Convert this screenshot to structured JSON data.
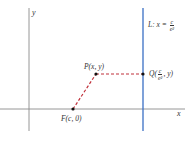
{
  "diagram": {
    "axes": {
      "x_label": "x",
      "y_label": "y",
      "axis_color": "#888888"
    },
    "directrix": {
      "prefix": "L: x = ",
      "fraction_numerator": "c",
      "fraction_denominator": "e²",
      "color": "#3a6fc4"
    },
    "points": {
      "P": {
        "label": "P(x, y)"
      },
      "F": {
        "label": "F(c, 0)"
      },
      "Q": {
        "prefix": "Q(",
        "fraction_numerator": "c",
        "fraction_denominator": "e²",
        "suffix": ", y)"
      }
    },
    "segments": {
      "color": "#c0303a",
      "style": "dashed",
      "list": [
        "F-P",
        "P-Q"
      ]
    },
    "point_color": "#111111"
  }
}
